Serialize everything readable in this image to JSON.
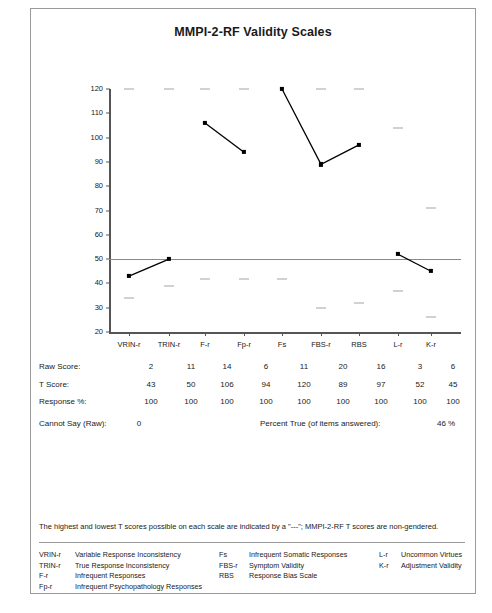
{
  "report": {
    "title": "MMPI-2-RF Validity Scales",
    "footnote": "The highest and lowest T scores possible on each scale are indicated by a \"---\"; MMPI-2-RF T scores are non-gendered."
  },
  "table": {
    "rows": [
      {
        "label": "Raw Score:",
        "values": [
          "2",
          "11",
          "14",
          "6",
          "11",
          "20",
          "16",
          "3",
          "6"
        ]
      },
      {
        "label": "T Score:",
        "values": [
          "43",
          "50",
          "106",
          "94",
          "120",
          "89",
          "97",
          "52",
          "45"
        ]
      },
      {
        "label": "Response %:",
        "values": [
          "100",
          "100",
          "100",
          "100",
          "100",
          "100",
          "100",
          "100",
          "100"
        ]
      }
    ],
    "cannot_say_label": "Cannot Say (Raw):",
    "cannot_say_value": "0",
    "percent_true_label": "Percent True (of items answered):",
    "percent_true_value": "46 %"
  },
  "legend": {
    "columns": [
      [
        {
          "abbr": "VRIN-r",
          "desc": "Variable Response Inconsistency"
        },
        {
          "abbr": "TRIN-r",
          "desc": "True Response Inconsistency"
        },
        {
          "abbr": "F-r",
          "desc": "Infrequent Responses"
        },
        {
          "abbr": "Fp-r",
          "desc": "Infrequent Psychopathology Responses"
        }
      ],
      [
        {
          "abbr": "Fs",
          "desc": "Infrequent Somatic Responses"
        },
        {
          "abbr": "FBS-r",
          "desc": "Symptom Validity"
        },
        {
          "abbr": "RBS",
          "desc": "Response Bias Scale"
        }
      ],
      [
        {
          "abbr": "L-r",
          "desc": "Uncommon Virtues"
        },
        {
          "abbr": "K-r",
          "desc": "Adjustment Validity"
        }
      ]
    ]
  },
  "chart_data": {
    "type": "line",
    "title": "MMPI-2-RF Validity Scales",
    "xlabel": "",
    "ylabel": "",
    "ylim": [
      20,
      120
    ],
    "yticks": [
      20,
      30,
      40,
      50,
      60,
      70,
      80,
      90,
      100,
      110,
      120
    ],
    "grid": false,
    "reference_line": 50,
    "legend_position": "none",
    "categories": [
      "VRIN-r",
      "TRIN-r",
      "F-r",
      "Fp-r",
      "Fs",
      "FBS-r",
      "RBS",
      "L-r",
      "K-r"
    ],
    "series": [
      {
        "name": "T Score",
        "values": [
          43,
          50,
          106,
          94,
          120,
          89,
          97,
          52,
          45
        ],
        "segments": [
          [
            0,
            1
          ],
          [
            2,
            3
          ],
          [
            4,
            5,
            6
          ],
          [
            7,
            8
          ]
        ]
      }
    ],
    "max_possible": [
      120,
      120,
      120,
      120,
      120,
      120,
      120,
      104,
      71
    ],
    "min_possible": [
      34,
      39,
      42,
      42,
      42,
      30,
      32,
      37,
      26
    ],
    "raw_scores": [
      2,
      11,
      14,
      6,
      11,
      20,
      16,
      3,
      6
    ],
    "response_percent": [
      100,
      100,
      100,
      100,
      100,
      100,
      100,
      100,
      100
    ]
  }
}
